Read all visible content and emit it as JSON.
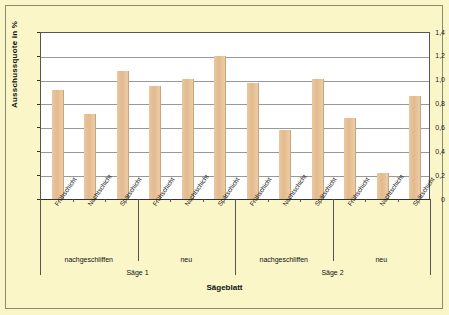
{
  "chart_data": {
    "type": "bar",
    "title": "",
    "xlabel": "Sägeblatt",
    "ylabel": "Ausschussquote in %",
    "ylim": [
      0,
      1.4
    ],
    "grid": true,
    "legend": "none",
    "ytick_labels": [
      "1,4",
      "1,2",
      "1,0",
      "0,8",
      "0,6",
      "0,4",
      "0,2",
      "0"
    ],
    "ytick_values": [
      1.4,
      1.2,
      1.0,
      0.8,
      0.6,
      0.4,
      0.2,
      0
    ],
    "categories": [
      "Frühschicht",
      "Nachtschicht",
      "Spätschicht",
      "Frühschicht",
      "Nachtschicht",
      "Spätschicht",
      "Frühschicht",
      "Nachtschicht",
      "Spätschicht",
      "Frühschicht",
      "Nachtschicht",
      "Spätschicht"
    ],
    "values": [
      0.91,
      0.71,
      1.07,
      0.95,
      1.01,
      1.2,
      0.97,
      0.58,
      1.01,
      0.68,
      0.22,
      0.86
    ],
    "group_level_1": [
      "nachgeschliffen",
      "neu",
      "nachgeschliffen",
      "neu"
    ],
    "group_level_2": [
      "Säge 1",
      "Säge 2"
    ],
    "bar_color": "#E6C096",
    "plot_background": "#FFFFFF",
    "figure_background": "#FAF6C8"
  },
  "axis": {
    "y": {
      "title": "Ausschussquote in %",
      "ticks": [
        {
          "label": "1,4"
        },
        {
          "label": "1,2"
        },
        {
          "label": "1,0"
        },
        {
          "label": "0,8"
        },
        {
          "label": "0,6"
        },
        {
          "label": "0,4"
        },
        {
          "label": "0,2"
        },
        {
          "label": "0"
        }
      ]
    },
    "x": {
      "title": "Sägeblatt",
      "shift_labels": [
        {
          "label": "Frühschicht"
        },
        {
          "label": "Nachtschicht"
        },
        {
          "label": "Spätschicht"
        },
        {
          "label": "Frühschicht"
        },
        {
          "label": "Nachtschicht"
        },
        {
          "label": "Spätschicht"
        },
        {
          "label": "Frühschicht"
        },
        {
          "label": "Nachtschicht"
        },
        {
          "label": "Spätschicht"
        },
        {
          "label": "Frühschicht"
        },
        {
          "label": "Nachtschicht"
        },
        {
          "label": "Spätschicht"
        }
      ],
      "groups_level1": [
        {
          "label": "nachgeschliffen"
        },
        {
          "label": "neu"
        },
        {
          "label": "nachgeschliffen"
        },
        {
          "label": "neu"
        }
      ],
      "groups_level2": [
        {
          "label": "Säge 1"
        },
        {
          "label": "Säge 2"
        }
      ]
    }
  }
}
